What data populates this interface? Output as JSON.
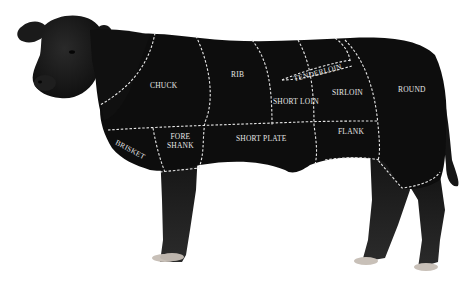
{
  "diagram": {
    "colors": {
      "background": "#ffffff",
      "body": "#0d0d0d",
      "cut_lines": "#e8e8e8",
      "label": "#e6e6e6",
      "hooves": "#c8c0b8"
    },
    "cuts": [
      {
        "id": "chuck",
        "label": "CHUCK"
      },
      {
        "id": "rib",
        "label": "RIB"
      },
      {
        "id": "tenderloin",
        "label": "TENDERLOIN"
      },
      {
        "id": "short-loin",
        "label": "SHORT LOIN"
      },
      {
        "id": "sirloin",
        "label": "SIRLOIN"
      },
      {
        "id": "round",
        "label": "ROUND"
      },
      {
        "id": "brisket",
        "label": "BRISKET"
      },
      {
        "id": "fore-shank",
        "label": "FORE SHANK",
        "line1": "FORE",
        "line2": "SHANK"
      },
      {
        "id": "short-plate",
        "label": "SHORT PLATE"
      },
      {
        "id": "flank",
        "label": "FLANK"
      }
    ]
  }
}
